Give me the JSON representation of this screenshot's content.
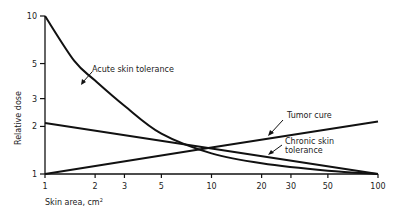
{
  "chart_data": {
    "type": "line",
    "title": "",
    "xlabel": "Skin area, cm²",
    "ylabel": "Relative dose",
    "xscale": "log",
    "yscale": "log",
    "xlim": [
      1,
      100
    ],
    "ylim": [
      1,
      10
    ],
    "x_ticks": [
      1,
      2,
      3,
      5,
      10,
      20,
      30,
      50,
      100
    ],
    "x_tick_labels": [
      "1",
      "2",
      "3",
      "5",
      "10",
      "20",
      "30",
      "50",
      "100"
    ],
    "y_ticks": [
      1,
      2,
      3,
      5,
      10
    ],
    "y_tick_labels": [
      "1",
      "2",
      "3",
      "5",
      "10"
    ],
    "grid": false,
    "legend": "none (inline annotations with arrows)",
    "series": [
      {
        "name": "Acute skin tolerance",
        "x": [
          1,
          1.5,
          2,
          3,
          5,
          10,
          20,
          50,
          100
        ],
        "values": [
          10,
          5.2,
          3.9,
          2.7,
          1.8,
          1.35,
          1.17,
          1.05,
          1.0
        ]
      },
      {
        "name": "Tumor cure",
        "x": [
          1,
          10,
          100
        ],
        "values": [
          1.0,
          1.47,
          2.15
        ]
      },
      {
        "name": "Chronic skin tolerance",
        "x": [
          1,
          10,
          100
        ],
        "values": [
          2.1,
          1.45,
          1.0
        ]
      }
    ],
    "annotations": [
      {
        "text": "Acute skin tolerance",
        "points_to": "Acute skin tolerance curve near x≈1.7"
      },
      {
        "text": "Tumor cure",
        "points_to": "Tumor cure line near x≈20"
      },
      {
        "text": "Chronic skin tolerance",
        "points_to": "Chronic skin tolerance line near x≈20"
      }
    ]
  },
  "labels": {
    "xlabel_main": "Skin area, cm",
    "xlabel_sup": "2",
    "ylabel": "Relative dose",
    "annot_acute": "Acute skin tolerance",
    "annot_tumor": "Tumor cure",
    "annot_chronic_1": "Chronic skin",
    "annot_chronic_2": "tolerance"
  }
}
